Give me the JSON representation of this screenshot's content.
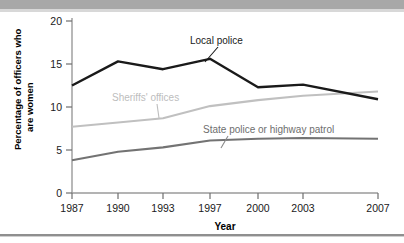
{
  "chart_data": {
    "type": "line",
    "title": "",
    "xlabel": "Year",
    "ylabel": "Percentage of officers who are women",
    "x": [
      1987,
      1990,
      1993,
      1997,
      2000,
      2003,
      2007
    ],
    "xticklabels": [
      "1987",
      "1990",
      "1993",
      "1997",
      "2000",
      "2003",
      "2007"
    ],
    "yticklabels": [
      "0",
      "5",
      "10",
      "15",
      "20"
    ],
    "yticks": [
      0,
      5,
      10,
      15,
      20
    ],
    "ylim": [
      0,
      20
    ],
    "xlim": [
      1987,
      2007
    ],
    "grid": false,
    "legend_position": "inline-annotations",
    "series": [
      {
        "name": "Local police",
        "color": "#1a1a1a",
        "values": [
          12.5,
          15.3,
          14.4,
          15.6,
          12.3,
          12.6,
          10.9
        ]
      },
      {
        "name": "Sheriffs' offices",
        "color": "#c0c0c0",
        "values": [
          7.7,
          8.2,
          8.7,
          10.1,
          10.8,
          11.3,
          11.8
        ]
      },
      {
        "name": "State police or highway patrol",
        "color": "#737373",
        "values": [
          3.8,
          4.8,
          5.3,
          6.1,
          6.3,
          6.4,
          6.3
        ]
      }
    ],
    "annotations": [
      {
        "text": "Local police",
        "color": "#1a1a1a"
      },
      {
        "text": "Sheriffs' offices",
        "color": "#bdbdbd"
      },
      {
        "text": "State police or highway patrol",
        "color": "#6e6e6e"
      }
    ]
  },
  "colors": {
    "local_police": "#1a1a1a",
    "sheriffs_offices": "#c0c0c0",
    "state_police": "#737373",
    "axis": "#9a9a9a",
    "band": "#a8a8a8"
  }
}
